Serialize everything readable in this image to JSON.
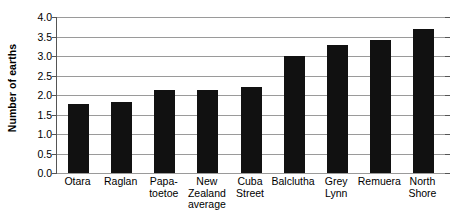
{
  "chart_data": {
    "type": "bar",
    "title": "",
    "subtitle": "",
    "xlabel": "",
    "ylabel": "Number of earths",
    "ylim": [
      0.0,
      4.0
    ],
    "ytick_step": 0.5,
    "ytick_labels": [
      "4.0",
      "3.5",
      "3.0",
      "2.5",
      "2.0",
      "1.5",
      "1.0",
      "0.5",
      "0.0"
    ],
    "ytick_values": [
      4.0,
      3.5,
      3.0,
      2.5,
      2.0,
      1.5,
      1.0,
      0.5,
      0.0
    ],
    "grid": true,
    "legend": false,
    "legend_position": "none",
    "bar_color": "#111111",
    "gridline_color": "#9a9a9a",
    "axis_color": "#555555",
    "background_color": "#ffffff",
    "categories": [
      "Otara",
      "Raglan",
      "Papa-\ntoetoe",
      "New\nZealand\naverage",
      "Cuba\nStreet",
      "Balclutha",
      "Grey\nLynn",
      "Remuera",
      "North\nShore"
    ],
    "values": [
      1.77,
      1.81,
      2.12,
      2.12,
      2.21,
      3.0,
      3.27,
      3.4,
      3.68
    ]
  }
}
